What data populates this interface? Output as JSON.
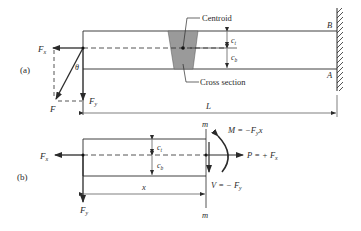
{
  "figure": {
    "part_a": {
      "label": "(a)",
      "force_labels": {
        "fx": "F",
        "fx_sub": "x",
        "fy": "F",
        "fy_sub": "y",
        "f": "F",
        "theta": "θ"
      },
      "annotations": {
        "centroid": "Centroid",
        "cross_section": "Cross section"
      },
      "dims": {
        "ct": "c",
        "ct_sub": "t",
        "cb": "c",
        "cb_sub": "b",
        "length": "L"
      },
      "points": {
        "b": "B",
        "a": "A"
      }
    },
    "part_b": {
      "label": "(b)",
      "force_labels": {
        "fx": "F",
        "fx_sub": "x",
        "fy": "F",
        "fy_sub": "y"
      },
      "dims": {
        "ct": "c",
        "ct_sub": "t",
        "cb": "c",
        "cb_sub": "b",
        "x": "x"
      },
      "section": {
        "top": "m",
        "bottom": "m"
      },
      "equations": {
        "moment": "M = −F",
        "moment_sub": "y",
        "moment_tail": "x",
        "axial": "P = + F",
        "axial_sub": "x",
        "shear": "V = − F",
        "shear_sub": "y"
      }
    },
    "colors": {
      "line": "#2a2a2a",
      "shade": "#9a9a9a",
      "background": "#ffffff"
    }
  }
}
